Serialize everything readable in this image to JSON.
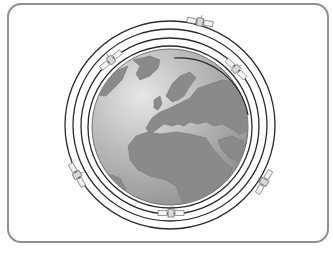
{
  "diagram": {
    "colors": {
      "frame_border": "#8e8e8e",
      "background": "#ffffff",
      "ocean_light": "#dcdcdc",
      "ocean_dark": "#9a9a9a",
      "land": "#8a8a8a",
      "land_edge": "#6e6e6e",
      "orbit": "#2a2a2a",
      "satellite": "#f4f4f4",
      "satellite_stroke": "#707070"
    },
    "globe": {
      "cx": 170,
      "cy": 127,
      "r": 78,
      "region_shown": "Europe and Africa"
    },
    "orbits": [
      {
        "name": "orbit-1",
        "rx": 82,
        "ry": 81
      },
      {
        "name": "orbit-2",
        "rx": 89,
        "ry": 88
      },
      {
        "name": "orbit-3",
        "rx": 97,
        "ry": 96
      },
      {
        "name": "orbit-4",
        "rx": 105,
        "ry": 104
      }
    ],
    "satellites": [
      {
        "name": "satellite-top",
        "x": 200,
        "y": 22,
        "angle": 10
      },
      {
        "name": "satellite-upper-left",
        "x": 111,
        "y": 60,
        "angle": -40
      },
      {
        "name": "satellite-upper-right",
        "x": 236,
        "y": 69,
        "angle": 45
      },
      {
        "name": "satellite-left",
        "x": 77,
        "y": 175,
        "angle": 60
      },
      {
        "name": "satellite-right",
        "x": 264,
        "y": 182,
        "angle": -60
      },
      {
        "name": "satellite-bottom",
        "x": 171,
        "y": 213,
        "angle": 0
      }
    ]
  }
}
